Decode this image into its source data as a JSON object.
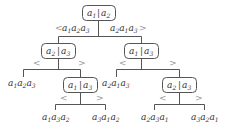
{
  "diagram": {
    "type": "decision-tree",
    "nodes": [
      {
        "id": "n0",
        "left": "a",
        "left_sub": "1",
        "right": "a",
        "right_sub": "2"
      },
      {
        "id": "n1",
        "left": "a",
        "left_sub": "2",
        "right": "a",
        "right_sub": "3"
      },
      {
        "id": "n2",
        "left": "a",
        "left_sub": "1",
        "right": "a",
        "right_sub": "3"
      },
      {
        "id": "n3",
        "left": "a",
        "left_sub": "1",
        "right": "a",
        "right_sub": "3"
      },
      {
        "id": "n4",
        "left": "a",
        "left_sub": "2",
        "right": "a",
        "right_sub": "3"
      }
    ],
    "edge_labels": {
      "n0_left": {
        "symbol": "<",
        "text": "a1a2a3",
        "subs": [
          "1",
          "2",
          "3"
        ]
      },
      "n0_right": {
        "symbol": ">",
        "text": "a2a1a3",
        "subs": [
          "2",
          "1",
          "3"
        ]
      },
      "lt": "<",
      "gt": ">"
    },
    "leaves": [
      {
        "id": "l0",
        "text": "a1a2a3",
        "subs": [
          "1",
          "2",
          "3"
        ]
      },
      {
        "id": "l1",
        "text": "a1a3a2",
        "subs": [
          "1",
          "3",
          "2"
        ]
      },
      {
        "id": "l2",
        "text": "a3a1a2",
        "subs": [
          "3",
          "1",
          "2"
        ]
      },
      {
        "id": "l3",
        "text": "a2a1a3",
        "subs": [
          "2",
          "1",
          "3"
        ]
      },
      {
        "id": "l4",
        "text": "a2a3a1",
        "subs": [
          "2",
          "3",
          "1"
        ]
      },
      {
        "id": "l5",
        "text": "a3a2a1",
        "subs": [
          "3",
          "2",
          "1"
        ]
      }
    ],
    "separator": "|",
    "letter": "a"
  }
}
